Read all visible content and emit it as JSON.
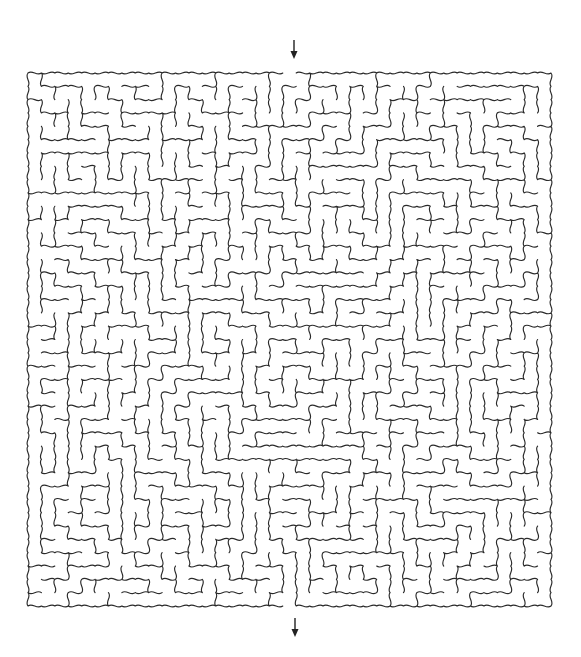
{
  "puzzle": {
    "type": "maze",
    "style": "wavy-walls",
    "grid": {
      "cols": 39,
      "rows": 40
    },
    "bounds": {
      "left": 28,
      "top": 73,
      "right": 551,
      "bottom": 606
    },
    "entrance": {
      "side": "top",
      "x": 294,
      "icon": "arrow-down-icon"
    },
    "exit": {
      "side": "bottom",
      "x": 295,
      "icon": "arrow-down-icon"
    },
    "wall_color": "#2a2a2a",
    "background_color": "#ffffff",
    "seed": 7
  }
}
